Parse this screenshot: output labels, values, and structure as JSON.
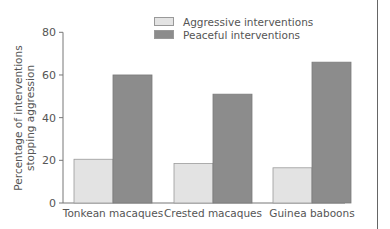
{
  "chart_data": {
    "type": "bar",
    "title": "",
    "xlabel": "",
    "ylabel": "Percentage of interventions stopping aggression",
    "ylabel_lines": [
      "Percentage of interventions",
      "stopping aggression"
    ],
    "categories": [
      "Tonkean macaques",
      "Crested macaques",
      "Guinea baboons"
    ],
    "series": [
      {
        "name": "Aggressive interventions",
        "values": [
          20.5,
          18.5,
          16.5
        ],
        "color": "#e3e3e3"
      },
      {
        "name": "Peaceful interventions",
        "values": [
          60,
          51,
          66
        ],
        "color": "#8c8c8c"
      }
    ],
    "ylim": [
      0,
      80
    ],
    "yticks": [
      0,
      20,
      40,
      60,
      80
    ],
    "grid": false,
    "legend_position": "top-center"
  },
  "legend": {
    "items": [
      {
        "label": "Aggressive interventions",
        "color": "#e3e3e3"
      },
      {
        "label": "Peaceful interventions",
        "color": "#8c8c8c"
      }
    ]
  }
}
